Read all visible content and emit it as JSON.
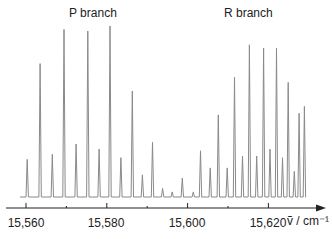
{
  "chart_data": {
    "type": "bar",
    "title": "",
    "xlabel": "ṽ / cm⁻¹",
    "ylabel": "",
    "xlim": [
      15555,
      15635
    ],
    "xticks": [
      15560,
      15580,
      15600,
      15620
    ],
    "xtick_labels": [
      "15,560",
      "15,580",
      "15,600",
      "15,620"
    ],
    "grid": false,
    "annotations": [
      {
        "text": "P branch",
        "x": 15575
      },
      {
        "text": "R branch",
        "x": 15612
      }
    ],
    "series": [
      {
        "name": "spectrum",
        "x": [
          15560.3,
          15563.5,
          15566.5,
          15569.4,
          15572.4,
          15575.3,
          15578.1,
          15580.8,
          15583.5,
          15586.3,
          15588.8,
          15591.3,
          15593.8,
          15596.2,
          15598.7,
          15601.4,
          15603.2,
          15605.6,
          15607.6,
          15609.8,
          15611.6,
          15613.6,
          15615.3,
          15617.1,
          15618.8,
          15620.4,
          15622.0,
          15623.5,
          15624.9,
          15626.4,
          15627.6,
          15628.9
        ],
        "values": [
          0.22,
          0.78,
          0.25,
          0.98,
          0.31,
          0.97,
          0.28,
          1.0,
          0.23,
          0.62,
          0.13,
          0.32,
          0.05,
          0.03,
          0.11,
          0.03,
          0.27,
          0.17,
          0.48,
          0.17,
          0.7,
          0.24,
          0.89,
          0.24,
          0.87,
          0.28,
          0.87,
          0.23,
          0.67,
          0.15,
          0.49,
          0.53
        ]
      }
    ]
  },
  "labels": {
    "p_branch": "P branch",
    "r_branch": "R branch",
    "tick_0": "15,560",
    "tick_1": "15,580",
    "tick_2": "15,600",
    "tick_3": "15,620",
    "axis_unit": "ṽ / cm⁻¹"
  }
}
